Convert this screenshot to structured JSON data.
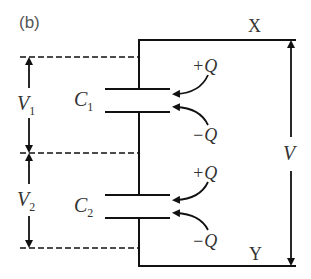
{
  "panel_label": "(b)",
  "nodes": {
    "top": "X",
    "bottom": "Y"
  },
  "capacitors": [
    {
      "name": "C",
      "sub": "1",
      "plus": "+Q",
      "minus": "−Q",
      "voltage": "V",
      "voltage_sub": "1"
    },
    {
      "name": "C",
      "sub": "2",
      "plus": "+Q",
      "minus": "−Q",
      "voltage": "V",
      "voltage_sub": "2"
    }
  ],
  "total_voltage": "V",
  "colors": {
    "line": "#111111",
    "text": "#333333"
  }
}
